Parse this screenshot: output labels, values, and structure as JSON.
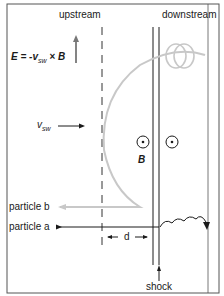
{
  "labels": {
    "upstream": "upstream",
    "downstream": "downstream",
    "electric_field": "E = -v",
    "efield_sub": "sw",
    "efield_tail": " × B",
    "vsw": "v",
    "vsw_sub": "sw",
    "B": "B",
    "particle_b": "particle b",
    "particle_a": "particle a",
    "d": "d",
    "shock": "shock"
  },
  "colors": {
    "line": "#1a1a1a",
    "trajectory": "#c8c8c8",
    "border": "#555555"
  }
}
